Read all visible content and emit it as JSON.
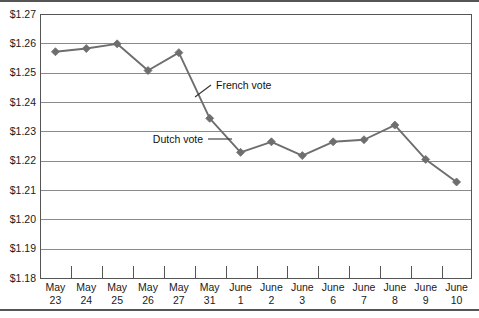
{
  "chart_data": {
    "type": "line",
    "title": "",
    "xlabel": "",
    "ylabel": "",
    "ylim": [
      1.18,
      1.27
    ],
    "ytick_step": 0.01,
    "grid": "horizontal",
    "legend": "none",
    "categories": [
      "May 23",
      "May 24",
      "May 25",
      "May 26",
      "May 27",
      "May 31",
      "June 1",
      "June 2",
      "June 3",
      "June 6",
      "June 7",
      "June 8",
      "June 9",
      "June 10"
    ],
    "category_lines": [
      [
        "May",
        "23"
      ],
      [
        "May",
        "24"
      ],
      [
        "May",
        "25"
      ],
      [
        "May",
        "26"
      ],
      [
        "May",
        "27"
      ],
      [
        "May",
        "31"
      ],
      [
        "June",
        "1"
      ],
      [
        "June",
        "2"
      ],
      [
        "June",
        "3"
      ],
      [
        "June",
        "6"
      ],
      [
        "June",
        "7"
      ],
      [
        "June",
        "8"
      ],
      [
        "June",
        "9"
      ],
      [
        "June",
        "10"
      ]
    ],
    "values": [
      1.2573,
      1.2584,
      1.26,
      1.2509,
      1.257,
      1.2346,
      1.223,
      1.2266,
      1.2219,
      1.2266,
      1.2273,
      1.2323,
      1.2206,
      1.2129
    ],
    "ytick_labels": [
      "$1.27",
      "$1.26",
      "$1.25",
      "$1.24",
      "$1.23",
      "$1.22",
      "$1.21",
      "$1.20",
      "$1.19",
      "$1.18"
    ],
    "ytick_values": [
      1.27,
      1.26,
      1.25,
      1.24,
      1.23,
      1.22,
      1.21,
      1.2,
      1.19,
      1.18
    ],
    "annotations": [
      {
        "label": "French vote",
        "points_to_category": "May 31"
      },
      {
        "label": "Dutch vote",
        "points_to_category": "June 1"
      }
    ],
    "series_color": "#6e6e6e",
    "marker": "diamond",
    "gridline_color": "#8a8a8a",
    "axis_color": "#555555"
  },
  "annotation_french": "French vote",
  "annotation_dutch": "Dutch vote",
  "ylabels": {
    "t0": "$1.27",
    "t1": "$1.26",
    "t2": "$1.25",
    "t3": "$1.24",
    "t4": "$1.23",
    "t5": "$1.22",
    "t6": "$1.21",
    "t7": "$1.20",
    "t8": "$1.19",
    "t9": "$1.18"
  },
  "xlabels": [
    {
      "top": "May",
      "bottom": "23"
    },
    {
      "top": "May",
      "bottom": "24"
    },
    {
      "top": "May",
      "bottom": "25"
    },
    {
      "top": "May",
      "bottom": "26"
    },
    {
      "top": "May",
      "bottom": "27"
    },
    {
      "top": "May",
      "bottom": "31"
    },
    {
      "top": "June",
      "bottom": "1"
    },
    {
      "top": "June",
      "bottom": "2"
    },
    {
      "top": "June",
      "bottom": "3"
    },
    {
      "top": "June",
      "bottom": "6"
    },
    {
      "top": "June",
      "bottom": "7"
    },
    {
      "top": "June",
      "bottom": "8"
    },
    {
      "top": "June",
      "bottom": "9"
    },
    {
      "top": "June",
      "bottom": "10"
    }
  ]
}
